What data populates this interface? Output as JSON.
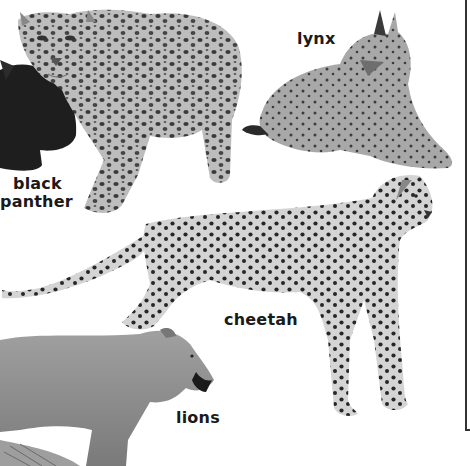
{
  "illustration": {
    "subject": "wild cats of the world",
    "style": "grayscale pencil illustration"
  },
  "labels": {
    "black_panther_line1": "black",
    "black_panther_line2": "panther",
    "lynx": "lynx",
    "cheetah": "cheetah",
    "lions": "lions"
  },
  "animals": [
    {
      "name": "leopard",
      "position": "top-left, standing facing viewer"
    },
    {
      "name": "black panther",
      "position": "left edge, partially visible, dark"
    },
    {
      "name": "lynx",
      "position": "top-right, crouching, looking right"
    },
    {
      "name": "cheetah",
      "position": "center, standing, facing right"
    },
    {
      "name": "lion",
      "position": "bottom-left, lioness head facing right"
    }
  ],
  "colors": {
    "background": "#ffffff",
    "text": "#1a1a1a",
    "fur_light": "#c8c8c8",
    "fur_mid": "#9a9a9a",
    "spots": "#2a2a2a",
    "panther": "#1e1e1e",
    "lion": "#8e8e8e"
  }
}
